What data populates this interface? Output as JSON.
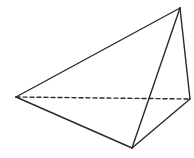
{
  "diagram": {
    "type": "tetrahedron",
    "stroke_color": "#2a2a2a",
    "background": "#ffffff",
    "vertices": {
      "apex": [
        180,
        8
      ],
      "left": [
        16,
        97
      ],
      "bottom": [
        132,
        148
      ],
      "right": [
        190,
        99
      ]
    },
    "edges": [
      {
        "from": "apex",
        "to": "left",
        "style": "solid"
      },
      {
        "from": "apex",
        "to": "bottom",
        "style": "solid"
      },
      {
        "from": "apex",
        "to": "right",
        "style": "solid"
      },
      {
        "from": "left",
        "to": "bottom",
        "style": "solid"
      },
      {
        "from": "bottom",
        "to": "right",
        "style": "solid"
      },
      {
        "from": "left",
        "to": "right",
        "style": "dashed"
      }
    ],
    "labels": []
  }
}
